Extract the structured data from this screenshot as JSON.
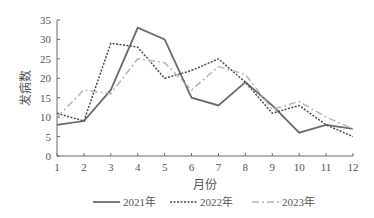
{
  "chart_data": {
    "type": "line",
    "title": "",
    "xlabel": "月份",
    "ylabel": "发病数",
    "x": [
      1,
      2,
      3,
      4,
      5,
      6,
      7,
      8,
      9,
      10,
      11,
      12
    ],
    "yticks": [
      0,
      5,
      10,
      15,
      20,
      25,
      30,
      35
    ],
    "ylim": [
      0,
      35
    ],
    "xlim": [
      1,
      12
    ],
    "grid": false,
    "legend_position": "bottom",
    "series": [
      {
        "name": "2021年",
        "style": "solid",
        "color": "#6b6b6b",
        "values": [
          8,
          9,
          17,
          33,
          30,
          15,
          13,
          19,
          13,
          6,
          8,
          7
        ]
      },
      {
        "name": "2022年",
        "style": "dotted",
        "color": "#4a4a4a",
        "values": [
          11,
          9,
          29,
          28,
          20,
          22,
          25,
          19,
          11,
          13,
          8,
          5
        ]
      },
      {
        "name": "2023年",
        "style": "dash-dot",
        "color": "#b5b5b5",
        "values": [
          10,
          17,
          16,
          25,
          24,
          17,
          23,
          21,
          12,
          14,
          10,
          7
        ]
      }
    ]
  }
}
